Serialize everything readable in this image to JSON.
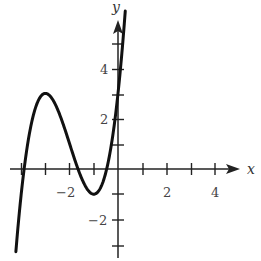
{
  "chart_data": {
    "type": "line",
    "title": "",
    "xlabel": "x",
    "ylabel": "y",
    "xlim": [
      -4.3,
      5.2
    ],
    "ylim": [
      -3.5,
      6
    ],
    "x_ticks": [
      -4,
      -3,
      -2,
      -1,
      0,
      1,
      2,
      3,
      4
    ],
    "y_ticks": [
      -3,
      -2,
      -1,
      1,
      2,
      3,
      4,
      5
    ],
    "x_tick_labels": [
      {
        "value": -2,
        "label": "−2"
      },
      {
        "value": 2,
        "label": "2"
      },
      {
        "value": 4,
        "label": "4"
      }
    ],
    "y_tick_labels": [
      {
        "value": -2,
        "label": "−2"
      },
      {
        "value": 2,
        "label": "2"
      },
      {
        "value": 4,
        "label": "4"
      }
    ],
    "grid": false,
    "series": [
      {
        "name": "f(x)",
        "description": "cubic curve with local max (-3, 3), local min (-1, -1), y-intercept 3",
        "x": [
          -4.2,
          -4.0,
          -3.5,
          -3.0,
          -2.5,
          -2.0,
          -1.5,
          -1.0,
          -0.5,
          0.0,
          0.25
        ],
        "y": [
          -3.1,
          -1.0,
          2.4,
          3.0,
          2.4,
          1.0,
          -0.4,
          -1.0,
          0.4,
          3.0,
          5.6
        ]
      }
    ],
    "key_points": {
      "local_max": [
        -3,
        3
      ],
      "local_min": [
        -1,
        -1
      ],
      "y_intercept": [
        0,
        3
      ]
    }
  },
  "axes": {
    "x_label": "x",
    "y_label": "y",
    "labels": {
      "x_neg2": "−2",
      "x_2": "2",
      "x_4": "4",
      "y_4": "4",
      "y_2": "2",
      "y_neg2": "−2"
    }
  }
}
